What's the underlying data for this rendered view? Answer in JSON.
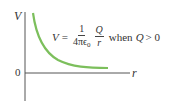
{
  "diagram": {
    "y_axis_label": "V",
    "x_axis_label": "r",
    "origin_label": "0",
    "formula": {
      "lhs": "V",
      "equals": "=",
      "frac1_num": "1",
      "frac1_den_main": "4πϵ",
      "frac1_den_sub": "0",
      "frac2_num": "Q",
      "frac2_den": "r",
      "condition_word": "when",
      "condition_var": "Q",
      "condition_rel": "> 0"
    },
    "curve_color": "#7cbf5c",
    "axis_color": "#555555",
    "curve_description": "V proportional to 1/r, decreasing toward zero as r increases"
  }
}
